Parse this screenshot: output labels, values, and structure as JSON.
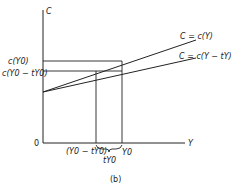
{
  "diagram": {
    "axes": {
      "y_label": "C",
      "x_label": "Y",
      "origin_label": "0"
    },
    "lines": [
      {
        "label": "C = c(Y)"
      },
      {
        "label": "C = c(Y − tY)"
      }
    ],
    "y_ticks": [
      {
        "label": "c(Y0)"
      },
      {
        "label": "c(Y0 − tY0)"
      }
    ],
    "x_ticks": [
      {
        "label": "(Y0 − tY0)"
      },
      {
        "label": "Y0"
      }
    ],
    "brace_label": "tY0",
    "caption": "(b)"
  }
}
